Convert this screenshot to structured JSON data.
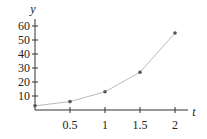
{
  "chart_data": {
    "type": "line",
    "title": "",
    "xlabel": "t",
    "ylabel": "y",
    "x": [
      0,
      0.5,
      1,
      1.5,
      2
    ],
    "series": [
      {
        "name": "y",
        "values": [
          3,
          6,
          13,
          27,
          55
        ]
      }
    ],
    "xticks": [
      0.5,
      1,
      1.5,
      2
    ],
    "xtick_labels": [
      "0.5",
      "1",
      "1.5",
      "2"
    ],
    "yticks": [
      10,
      20,
      30,
      40,
      50,
      60
    ],
    "ytick_labels": [
      "10",
      "20",
      "30",
      "40",
      "50",
      "60"
    ],
    "xlim": [
      0,
      2.2
    ],
    "ylim": [
      0,
      65
    ],
    "grid": false,
    "legend": "none",
    "colors": {
      "line": "#bbbbbb",
      "marker": "#555555",
      "axis": "#333333"
    }
  }
}
